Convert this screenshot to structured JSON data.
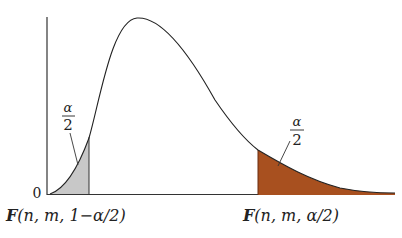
{
  "figure": {
    "origin_label": "0",
    "left_tail": {
      "area_numerator": "α",
      "area_denominator": "2",
      "critical_label_prefix": "F",
      "critical_label_args": "(n, m, 1−α/2)",
      "fill_color": "#c8c8c8"
    },
    "right_tail": {
      "area_numerator": "α",
      "area_denominator": "2",
      "critical_label_prefix": "F",
      "critical_label_args": "(n, m, α/2)",
      "fill_color": "#a8501f"
    },
    "curve_color": "#222222"
  }
}
